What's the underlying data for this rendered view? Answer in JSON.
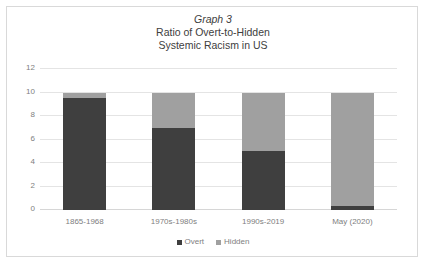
{
  "chart_data": {
    "type": "bar",
    "subtype": "stacked-column",
    "title": "Graph 3 Ratio of Overt-to-Hidden Systemic Racism in US",
    "title_lines": [
      "Graph 3",
      "Ratio of Overt-to-Hidden",
      "Systemic Racism in US"
    ],
    "xlabel": "",
    "ylabel": "",
    "categories": [
      "1865-1968",
      "1970s-1980s",
      "1990s-2019",
      "May (2020)"
    ],
    "series": [
      {
        "name": "Overt",
        "color": "#3f3f3f",
        "values": [
          9.5,
          7,
          5,
          0.35
        ]
      },
      {
        "name": "Hidden",
        "color": "#a0a0a0",
        "values": [
          0.5,
          3,
          5,
          9.65
        ]
      }
    ],
    "totals": [
      10,
      10,
      10,
      10
    ],
    "ylim": [
      0,
      12
    ],
    "yticks": [
      0,
      2,
      4,
      6,
      8,
      10,
      12
    ],
    "ytick_labels": [
      "0",
      "2",
      "4",
      "6",
      "8",
      "10",
      "12"
    ],
    "grid": "horizontal",
    "legend_position": "bottom-center",
    "legend_entries": [
      "Overt",
      "Hidden"
    ],
    "border_color": "#d9d9d9",
    "gridline_color": "#e4e4e4",
    "text_color": "#808080",
    "background": "#ffffff"
  }
}
